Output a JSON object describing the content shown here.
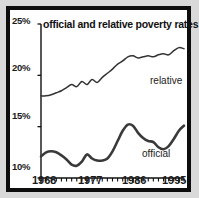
{
  "chart_data": {
    "type": "line",
    "title": "official and relative poverty rates",
    "xlabel": "",
    "ylabel": "",
    "ylim": [
      10,
      25
    ],
    "xlim": [
      1968,
      1996
    ],
    "grid": false,
    "legend_position": "inline-labels",
    "y_ticks": [
      "10%",
      "15%",
      "20%",
      "25%"
    ],
    "y_tick_values": [
      10,
      15,
      20,
      25
    ],
    "x_ticks": [
      "1968",
      "1977",
      "1986",
      "1995"
    ],
    "x_tick_values": [
      1968,
      1977,
      1986,
      1995
    ],
    "x_minor_tick_interval": 1,
    "series": [
      {
        "name": "relative",
        "label": "relative",
        "color": "#333333",
        "width": 1.5,
        "x": [
          1968,
          1969,
          1970,
          1971,
          1972,
          1973,
          1974,
          1975,
          1976,
          1977,
          1978,
          1979,
          1980,
          1981,
          1982,
          1983,
          1984,
          1985,
          1986,
          1987,
          1988,
          1989,
          1990,
          1991,
          1992,
          1993,
          1994,
          1995,
          1996
        ],
        "values": [
          18.0,
          18.0,
          18.1,
          18.3,
          18.5,
          18.8,
          19.1,
          18.9,
          19.4,
          19.1,
          19.6,
          19.3,
          19.8,
          20.2,
          20.6,
          21.1,
          21.4,
          21.8,
          21.9,
          21.7,
          21.8,
          21.9,
          21.8,
          22.0,
          22.1,
          22.0,
          22.4,
          22.7,
          22.6
        ]
      },
      {
        "name": "official",
        "label": "official",
        "color": "#3a3a3a",
        "width": 2.6,
        "x": [
          1968,
          1969,
          1970,
          1971,
          1972,
          1973,
          1974,
          1975,
          1976,
          1977,
          1978,
          1979,
          1980,
          1981,
          1982,
          1983,
          1984,
          1985,
          1986,
          1987,
          1988,
          1989,
          1990,
          1991,
          1992,
          1993,
          1994,
          1995,
          1996
        ],
        "values": [
          12.1,
          12.5,
          12.6,
          12.5,
          12.2,
          11.8,
          11.3,
          11.2,
          11.6,
          12.3,
          11.9,
          11.7,
          11.7,
          11.9,
          12.6,
          13.6,
          14.6,
          15.2,
          15.1,
          14.4,
          13.9,
          13.6,
          13.5,
          13.0,
          12.8,
          13.1,
          13.8,
          14.6,
          15.1
        ]
      }
    ],
    "annotations": [
      {
        "text": "relative",
        "x_px": 140,
        "y_px": 65
      },
      {
        "text": "official",
        "x_px": 132,
        "y_px": 138
      }
    ]
  },
  "frame": {
    "border_color": "#0d0d0d",
    "background": "#ffffff",
    "page_background": "#d9d9d9"
  }
}
